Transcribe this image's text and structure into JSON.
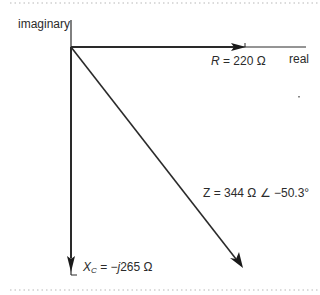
{
  "diagram": {
    "type": "phasor-diagram",
    "axes": {
      "imaginary_label": "imaginary",
      "real_label": "real"
    },
    "vectors": {
      "resistance": {
        "symbol": "R",
        "equals": " = 220 Ω",
        "direction": "positive real"
      },
      "reactance": {
        "symbol": "X",
        "subscript": "C",
        "equals": " = −",
        "j": "j",
        "value": "265 Ω",
        "direction": "negative imaginary"
      },
      "impedance": {
        "text": "Z = 344 Ω ∠ −50.3°",
        "magnitude": "344 Ω",
        "angle": "−50.3°"
      }
    },
    "colors": {
      "line": "#2a2a2a",
      "dotted_border": "#b8b8b8"
    }
  }
}
